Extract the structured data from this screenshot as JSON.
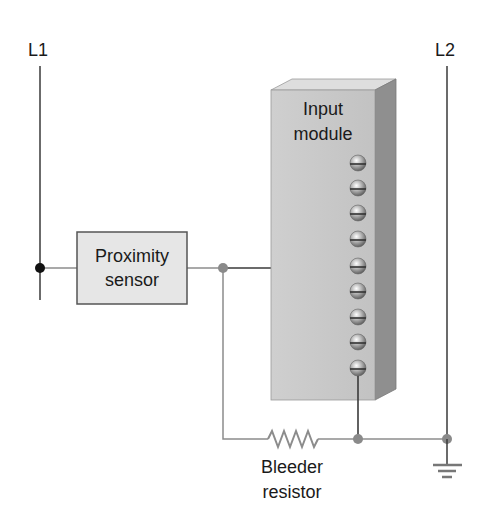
{
  "labels": {
    "line1": "L1",
    "line2": "L2",
    "sensor_line1": "Proximity",
    "sensor_line2": "sensor",
    "module_line1": "Input",
    "module_line2": "module",
    "resistor_line1": "Bleeder",
    "resistor_line2": "resistor"
  },
  "components": {
    "terminal_count": 9,
    "sensor_connected_terminal": 5,
    "bottom_connected_terminal": 9
  },
  "colors": {
    "wire_dark": "#3a3a3a",
    "wire_gray": "#8c8c8c",
    "node_black": "#111111",
    "node_gray": "#8a8a8a",
    "sensor_fill": "#e6e6e6",
    "module_front": "#c9c9c9",
    "module_top": "#dedede",
    "module_side": "#8f8f8f"
  }
}
